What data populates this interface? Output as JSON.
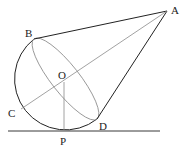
{
  "diagram": {
    "colors": {
      "primary_line": "#222222",
      "secondary_line": "#8a8a8a",
      "background": "#ffffff"
    },
    "points": {
      "A": {
        "label": "A",
        "x": 167,
        "y": 11
      },
      "B": {
        "label": "B",
        "x": 34,
        "y": 39
      },
      "O": {
        "label": "O",
        "x": 64,
        "y": 82
      },
      "C": {
        "label": "C",
        "x": 21,
        "y": 109
      },
      "D": {
        "label": "D",
        "x": 97,
        "y": 119
      },
      "P": {
        "label": "P",
        "x": 64,
        "y": 131
      }
    },
    "segments": [
      "AB",
      "AD",
      "AC",
      "OP"
    ],
    "ground_line": "line through P"
  }
}
